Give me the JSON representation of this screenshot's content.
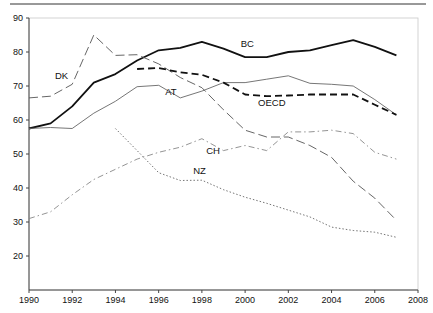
{
  "chart_data": {
    "type": "line",
    "title": "",
    "xlabel": "",
    "ylabel": "",
    "xlim": [
      1990,
      2008
    ],
    "ylim": [
      10,
      90
    ],
    "x_ticks": [
      1990,
      1992,
      1994,
      1996,
      1998,
      2000,
      2002,
      2004,
      2006,
      2008
    ],
    "y_ticks": [
      20,
      30,
      40,
      50,
      60,
      70,
      80,
      90
    ],
    "grid": false,
    "legend": "inline labels",
    "series": [
      {
        "name": "BC",
        "style": "solid-thick",
        "color": "#111111",
        "x": [
          1990,
          1991,
          1992,
          1993,
          1994,
          1995,
          1996,
          1997,
          1998,
          1999,
          2000,
          2001,
          2002,
          2003,
          2004,
          2005,
          2006,
          2007
        ],
        "values": [
          57.5,
          59,
          64,
          71,
          73.5,
          77.5,
          80.5,
          81.2,
          83,
          81,
          78.5,
          78.5,
          80,
          80.5,
          82,
          83.5,
          81.5,
          79
        ],
        "label_pos": [
          1999.8,
          81.5
        ]
      },
      {
        "name": "DK",
        "style": "long-dash",
        "color": "#555555",
        "x": [
          1990,
          1991,
          1992,
          1993,
          1994,
          1995,
          1996,
          1997,
          1998,
          1999,
          2000,
          2001,
          2002,
          2003,
          2004,
          2005,
          2006,
          2007
        ],
        "values": [
          66.5,
          67,
          70.5,
          85,
          79,
          79.2,
          76.5,
          72.5,
          69.5,
          63,
          57,
          55,
          55,
          52.5,
          49,
          42,
          37,
          30.5
        ],
        "label_pos": [
          1991.2,
          72
        ]
      },
      {
        "name": "AT",
        "style": "solid-thin",
        "color": "#666666",
        "x": [
          1990,
          1991,
          1992,
          1993,
          1994,
          1995,
          1996,
          1997,
          1998,
          1999,
          2000,
          2001,
          2002,
          2003,
          2004,
          2005,
          2006,
          2007
        ],
        "values": [
          57.5,
          57.8,
          57.5,
          62,
          65.5,
          69.8,
          70.2,
          66.5,
          68.5,
          71,
          71,
          72,
          73,
          70.8,
          70.5,
          70,
          66,
          61.5
        ],
        "label_pos": [
          1996.3,
          67.3
        ]
      },
      {
        "name": "OECD",
        "style": "dash-thick",
        "color": "#111111",
        "x": [
          1995,
          1996,
          1997,
          1998,
          1999,
          2000,
          2001,
          2002,
          2003,
          2004,
          2005,
          2006,
          2007
        ],
        "values": [
          75,
          75.3,
          74,
          73.3,
          71,
          67.5,
          67,
          67.2,
          67.5,
          67.5,
          67.5,
          64.5,
          61.5
        ],
        "label_pos": [
          2000.6,
          64
        ]
      },
      {
        "name": "CH",
        "style": "dash-dot",
        "color": "#888888",
        "x": [
          1990,
          1991,
          1992,
          1993,
          1994,
          1995,
          1996,
          1997,
          1998,
          1999,
          2000,
          2001,
          2002,
          2003,
          2004,
          2005,
          2006,
          2007
        ],
        "values": [
          31,
          33,
          38,
          42.5,
          45.5,
          48.5,
          50.5,
          52,
          54.5,
          51,
          52.5,
          51,
          56.5,
          56.5,
          57,
          56,
          50.5,
          48.5
        ],
        "label_pos": [
          1998.2,
          50
        ]
      },
      {
        "name": "NZ",
        "style": "dotted",
        "color": "#666666",
        "x": [
          1994,
          1995,
          1996,
          1997,
          1998,
          1999,
          2000,
          2001,
          2002,
          2003,
          2004,
          2005,
          2006,
          2007
        ],
        "values": [
          57.5,
          51,
          44.5,
          42.2,
          42.3,
          39.5,
          37.3,
          35.5,
          33.5,
          31.5,
          28.5,
          27.5,
          27,
          25.5
        ],
        "label_pos": [
          1997.6,
          44
        ]
      }
    ]
  },
  "decor": {
    "header_rule": true
  }
}
